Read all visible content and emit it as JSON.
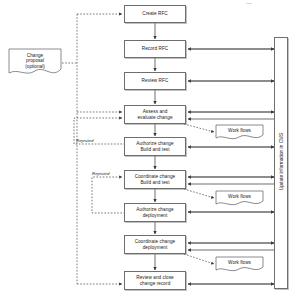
{
  "diagram": {
    "background_color": "#ffffff",
    "line_color": "#555555",
    "box_border_color": "#6e6e6e",
    "box_fill_color": "#ffffff",
    "text_color": "#1a1a1a",
    "process_steps": [
      {
        "id": "create-rfc",
        "label": "Create RFC",
        "x": 124,
        "y": 5,
        "w": 62,
        "h": 18
      },
      {
        "id": "record-rfc",
        "label": "Record RFC",
        "x": 124,
        "y": 40,
        "w": 62,
        "h": 18
      },
      {
        "id": "review-rfc",
        "label": "Review RFC",
        "x": 124,
        "y": 72,
        "w": 62,
        "h": 18
      },
      {
        "id": "assess-evaluate",
        "label": "Assess and\nevaluate change",
        "x": 124,
        "y": 105,
        "w": 62,
        "h": 19
      },
      {
        "id": "authorize-build",
        "label": "Authorize change\nBuild and test",
        "x": 124,
        "y": 137,
        "w": 62,
        "h": 19
      },
      {
        "id": "coordinate-build",
        "label": "Coordinate change\nBuild and test",
        "x": 124,
        "y": 170,
        "w": 62,
        "h": 19
      },
      {
        "id": "authorize-deployment",
        "label": "Authorize change\ndeployment",
        "x": 124,
        "y": 203,
        "w": 62,
        "h": 19
      },
      {
        "id": "coordinate-deployment",
        "label": "Coordinate change\ndeployment",
        "x": 124,
        "y": 235,
        "w": 62,
        "h": 19
      },
      {
        "id": "review-close",
        "label": "Review and close\nchange record",
        "x": 124,
        "y": 271,
        "w": 62,
        "h": 19
      }
    ],
    "change_proposal_note": {
      "label": "Change\nproposal\n(optional)",
      "x": 8,
      "y": 48,
      "w": 54,
      "h": 30
    },
    "work_flow_notes": [
      {
        "id": "work-flows-1",
        "label": "Work flows",
        "x": 215,
        "y": 124,
        "w": 49,
        "h": 17
      },
      {
        "id": "work-flows-2",
        "label": "Work flows",
        "x": 215,
        "y": 190,
        "w": 49,
        "h": 17
      },
      {
        "id": "work-flows-3",
        "label": "Work flows",
        "x": 215,
        "y": 256,
        "w": 49,
        "h": 17
      }
    ],
    "edge_labels": [
      {
        "id": "rejected-1",
        "label": "Rejected",
        "x": 76,
        "y": 138
      },
      {
        "id": "rejected-2",
        "label": "Rejected",
        "x": 92,
        "y": 171
      }
    ],
    "cms_bar": {
      "label": "Update information in CMS",
      "x": 274,
      "y": 37,
      "w": 14,
      "h": 252
    }
  }
}
